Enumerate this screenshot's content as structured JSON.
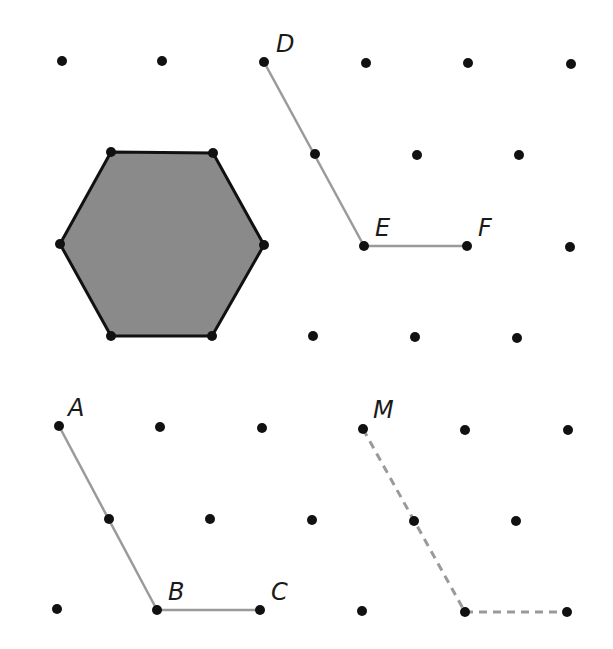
{
  "diagram": {
    "type": "triangular dot grid with hexagon and segments",
    "colors": {
      "background": "#ffffff",
      "dot": "#111111",
      "hexagon_fill": "#8a8a8a",
      "hexagon_stroke": "#111111",
      "segment": "#9a9a9a",
      "label": "#1a1a1a"
    },
    "dots": [
      [
        62,
        61
      ],
      [
        162,
        61
      ],
      [
        264,
        62
      ],
      [
        366,
        63
      ],
      [
        468,
        63
      ],
      [
        571,
        64
      ],
      [
        111,
        152
      ],
      [
        213,
        153
      ],
      [
        315,
        154
      ],
      [
        417,
        155
      ],
      [
        519,
        155
      ],
      [
        60,
        244
      ],
      [
        264,
        245
      ],
      [
        364,
        246
      ],
      [
        467,
        246
      ],
      [
        570,
        247
      ],
      [
        111,
        336
      ],
      [
        212,
        336
      ],
      [
        313,
        336
      ],
      [
        415,
        337
      ],
      [
        517,
        338
      ],
      [
        59,
        426
      ],
      [
        160,
        427
      ],
      [
        262,
        428
      ],
      [
        363,
        429
      ],
      [
        465,
        430
      ],
      [
        568,
        430
      ],
      [
        109,
        519
      ],
      [
        210,
        519
      ],
      [
        312,
        520
      ],
      [
        414,
        521
      ],
      [
        516,
        521
      ],
      [
        57,
        609
      ],
      [
        157,
        610
      ],
      [
        260,
        610
      ],
      [
        362,
        611
      ],
      [
        465,
        612
      ],
      [
        567,
        612
      ]
    ],
    "hexagon": {
      "name": "shaded hexagon",
      "vertices": [
        [
          111,
          152
        ],
        [
          213,
          153
        ],
        [
          264,
          245
        ],
        [
          212,
          336
        ],
        [
          111,
          336
        ],
        [
          60,
          244
        ]
      ]
    },
    "segments": [
      {
        "name": "DE",
        "from": [
          264,
          62
        ],
        "to": [
          364,
          246
        ],
        "style": "solid"
      },
      {
        "name": "EF",
        "from": [
          364,
          246
        ],
        "to": [
          467,
          246
        ],
        "style": "solid"
      },
      {
        "name": "AB",
        "from": [
          59,
          426
        ],
        "to": [
          157,
          610
        ],
        "style": "solid"
      },
      {
        "name": "BC",
        "from": [
          157,
          610
        ],
        "to": [
          260,
          610
        ],
        "style": "solid"
      },
      {
        "name": "M-path-1",
        "from": [
          363,
          429
        ],
        "to": [
          465,
          612
        ],
        "style": "dashed"
      },
      {
        "name": "M-path-2",
        "from": [
          465,
          612
        ],
        "to": [
          567,
          612
        ],
        "style": "dashed"
      }
    ],
    "labels": [
      {
        "id": "D",
        "text": "D",
        "x": 276,
        "y": 52
      },
      {
        "id": "E",
        "text": "E",
        "x": 375,
        "y": 236
      },
      {
        "id": "F",
        "text": "F",
        "x": 478,
        "y": 236
      },
      {
        "id": "A",
        "text": "A",
        "x": 68,
        "y": 416
      },
      {
        "id": "M",
        "text": "M",
        "x": 373,
        "y": 418
      },
      {
        "id": "B",
        "text": "B",
        "x": 168,
        "y": 600
      },
      {
        "id": "C",
        "text": "C",
        "x": 271,
        "y": 600
      }
    ]
  }
}
